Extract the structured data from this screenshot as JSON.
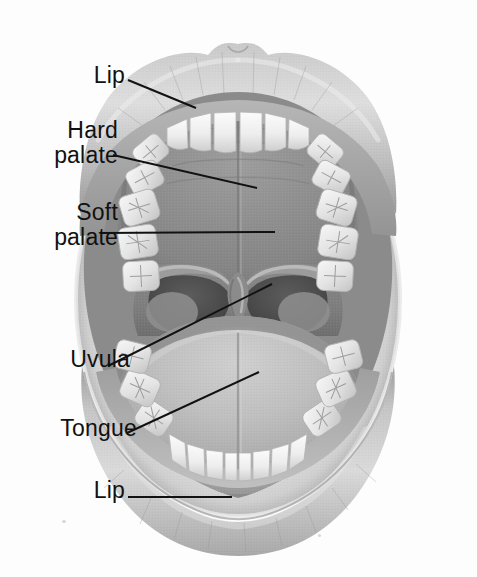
{
  "figure": {
    "style": "grayscale halftone medical illustration",
    "background_color": "#fdfdfd",
    "line_color": "#111111"
  },
  "labels": [
    {
      "id": "lip-top",
      "text": "Lip",
      "lines": [
        "Lip"
      ],
      "x": 110,
      "y": 80,
      "leader": {
        "from": [
          128,
          80
        ],
        "to": [
          196,
          108
        ]
      }
    },
    {
      "id": "hard-palate",
      "text": "Hard palate",
      "lines": [
        "Hard",
        "palate"
      ],
      "x": 113,
      "y": 142,
      "leader": {
        "from": [
          113,
          155
        ],
        "to": [
          257,
          188
        ]
      }
    },
    {
      "id": "soft-palate",
      "text": "Soft palate",
      "lines": [
        "Soft",
        "palate"
      ],
      "x": 113,
      "y": 224,
      "leader": {
        "from": [
          100,
          233
        ],
        "to": [
          275,
          232
        ]
      }
    },
    {
      "id": "uvula",
      "text": "Uvula",
      "lines": [
        "Uvula"
      ],
      "x": 118,
      "y": 368,
      "leader": {
        "from": [
          108,
          366
        ],
        "to": [
          272,
          284
        ]
      }
    },
    {
      "id": "tongue",
      "text": "Tongue",
      "lines": [
        "Tongue"
      ],
      "x": 127,
      "y": 436,
      "leader": {
        "from": [
          127,
          433
        ],
        "to": [
          259,
          372
        ]
      }
    },
    {
      "id": "lip-bottom",
      "text": "Lip",
      "lines": [
        "Lip"
      ],
      "x": 110,
      "y": 496,
      "leader": {
        "from": [
          128,
          497
        ],
        "to": [
          232,
          497
        ]
      }
    }
  ],
  "structures": [
    {
      "name": "upper-lip",
      "label": "Lip",
      "tone": "#b9b9b9"
    },
    {
      "name": "lower-lip",
      "label": "Lip",
      "tone": "#b4b4b4"
    },
    {
      "name": "hard-palate",
      "label": "Hard palate",
      "tone": "#909090"
    },
    {
      "name": "soft-palate",
      "label": "Soft palate",
      "tone": "#7e7e7e"
    },
    {
      "name": "uvula",
      "label": "Uvula",
      "tone": "#868686"
    },
    {
      "name": "tongue",
      "label": "Tongue",
      "tone": "#b6b6b6"
    },
    {
      "name": "upper-teeth",
      "label": "Upper teeth",
      "tone": "#efefef"
    },
    {
      "name": "lower-teeth",
      "label": "Lower teeth",
      "tone": "#ededed"
    },
    {
      "name": "oropharynx",
      "label": "Throat",
      "tone": "#4e4e4e"
    },
    {
      "name": "palatine-tonsil",
      "label": "Tonsil",
      "tone": "#9a9a9a"
    }
  ],
  "colors": {
    "background": "#fdfdfd",
    "leader_line": "#111111",
    "label_text": "#111111",
    "lip_light": "#d6d6d6",
    "lip_mid": "#b0b0b0",
    "lip_dark": "#8e8e8e",
    "palate_light": "#a6a6a6",
    "palate_dark": "#7b7b7b",
    "tongue_light": "#c6c6c6",
    "tongue_dark": "#9e9e9e",
    "tooth_light": "#f6f6f6",
    "tooth_shadow": "#c2c2c2",
    "throat_dark": "#4a4a4a"
  }
}
